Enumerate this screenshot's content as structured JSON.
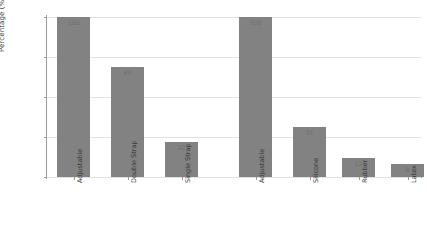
{
  "chart_data": {
    "type": "bar",
    "title": "",
    "xlabel": "",
    "ylabel": "Percentage (%)",
    "ylim": [
      0,
      100
    ],
    "yticks": [
      "0",
      "25",
      "50",
      "75",
      "100"
    ],
    "grid": true,
    "legend": "none",
    "categories": [
      "Adjustable",
      "Double Strap",
      "Single Strap",
      "Adjustable",
      "Silicone",
      "Rubber",
      "Latex"
    ],
    "values": [
      100,
      69,
      22,
      100,
      31,
      12,
      8
    ],
    "bar_labels": [
      "100",
      "69",
      "22",
      "100",
      "31",
      "12",
      "8"
    ],
    "bars": [
      {
        "category": "Adjustable",
        "value": 100,
        "label": "100",
        "group": 1
      },
      {
        "category": "Double Strap",
        "value": 69,
        "label": "69",
        "group": 1
      },
      {
        "category": "Single Strap",
        "value": 22,
        "label": "22",
        "group": 1
      },
      {
        "category": "Adjustable",
        "value": 100,
        "label": "100",
        "group": 2
      },
      {
        "category": "Silicone",
        "value": 31,
        "label": "31",
        "group": 2
      },
      {
        "category": "Rubber",
        "value": 12,
        "label": "12",
        "group": 2
      },
      {
        "category": "Latex",
        "value": 8,
        "label": "8",
        "group": 2
      }
    ],
    "colors": {
      "bar": "#828282",
      "background": "#ffffff",
      "gridline": "#e2e2e2",
      "axis": "#9a9a9a",
      "value_label": "#6f6f6f",
      "tick_label": "#3a3a3a"
    }
  }
}
